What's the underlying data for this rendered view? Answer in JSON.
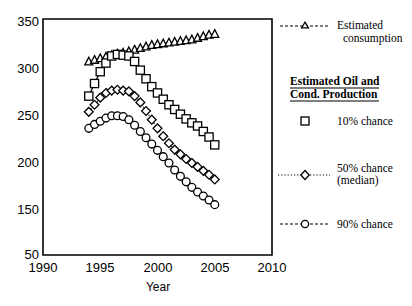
{
  "chart_data": {
    "type": "line",
    "title": "",
    "xlabel": "Year",
    "ylabel": "",
    "xlim": [
      1990,
      2010
    ],
    "ylim": [
      50,
      350
    ],
    "xticks": [
      "1990",
      "1995",
      "2000",
      "2005",
      "2010"
    ],
    "xtick_values": [
      1990,
      1995,
      2000,
      2005,
      2010
    ],
    "yticks": [
      "50",
      "150",
      "200",
      "250",
      "300",
      "350"
    ],
    "ytick_values": [
      50,
      150,
      200,
      250,
      300,
      350
    ],
    "grid": false,
    "legend_position": "right",
    "x": [
      1994,
      1994.5,
      1995,
      1995.5,
      1996,
      1996.5,
      1997,
      1997.5,
      1998,
      1998.5,
      1999,
      1999.5,
      2000,
      2000.5,
      2001,
      2001.5,
      2002,
      2002.5,
      2003,
      2003.5,
      2004,
      2004.5,
      2005
    ],
    "series": [
      {
        "name": "Estimated consumption",
        "marker": "triangle",
        "linestyle": "dashed",
        "values": [
          296,
          298,
          300,
          302,
          304,
          306,
          307,
          309,
          311,
          313,
          315,
          317,
          318,
          319,
          320,
          321,
          322,
          323,
          324,
          326,
          328,
          330,
          331
        ]
      },
      {
        "name": "10% chance",
        "marker": "square",
        "linestyle": "solid",
        "values": [
          252,
          268,
          283,
          294,
          303,
          305,
          304,
          303,
          296,
          285,
          274,
          264,
          256,
          248,
          241,
          235,
          229,
          223,
          218,
          214,
          207,
          200,
          190
        ]
      },
      {
        "name": "50% chance (median)",
        "marker": "diamond",
        "linestyle": "dotted",
        "values": [
          232,
          241,
          250,
          256,
          259,
          260,
          259,
          258,
          252,
          244,
          233,
          222,
          211,
          201,
          192,
          184,
          178,
          172,
          167,
          162,
          157,
          152,
          146
        ]
      },
      {
        "name": "90% chance",
        "marker": "circle",
        "linestyle": "dashed",
        "values": [
          211,
          216,
          220,
          224,
          227,
          227,
          226,
          222,
          215,
          207,
          199,
          191,
          183,
          175,
          167,
          158,
          150,
          143,
          136,
          130,
          125,
          120,
          114
        ]
      }
    ]
  },
  "axes": {
    "x_title": "Year",
    "x_tick_labels": [
      "1990",
      "1995",
      "2000",
      "2005",
      "2010"
    ],
    "y_tick_labels": [
      "350",
      "300",
      "250",
      "200",
      "150",
      "50"
    ]
  },
  "legend": {
    "consumption_label_line1": "Estimated",
    "consumption_label_line2": "consumption",
    "heading_line1": "Estimated Oil and",
    "heading_line2": "Cond. Production",
    "item_10_label": "10% chance",
    "item_50_label_line1": "50% chance",
    "item_50_label_line2": "(median)",
    "item_90_label": "90% chance"
  },
  "colors": {
    "ink": "#000000",
    "paper": "#ffffff"
  }
}
